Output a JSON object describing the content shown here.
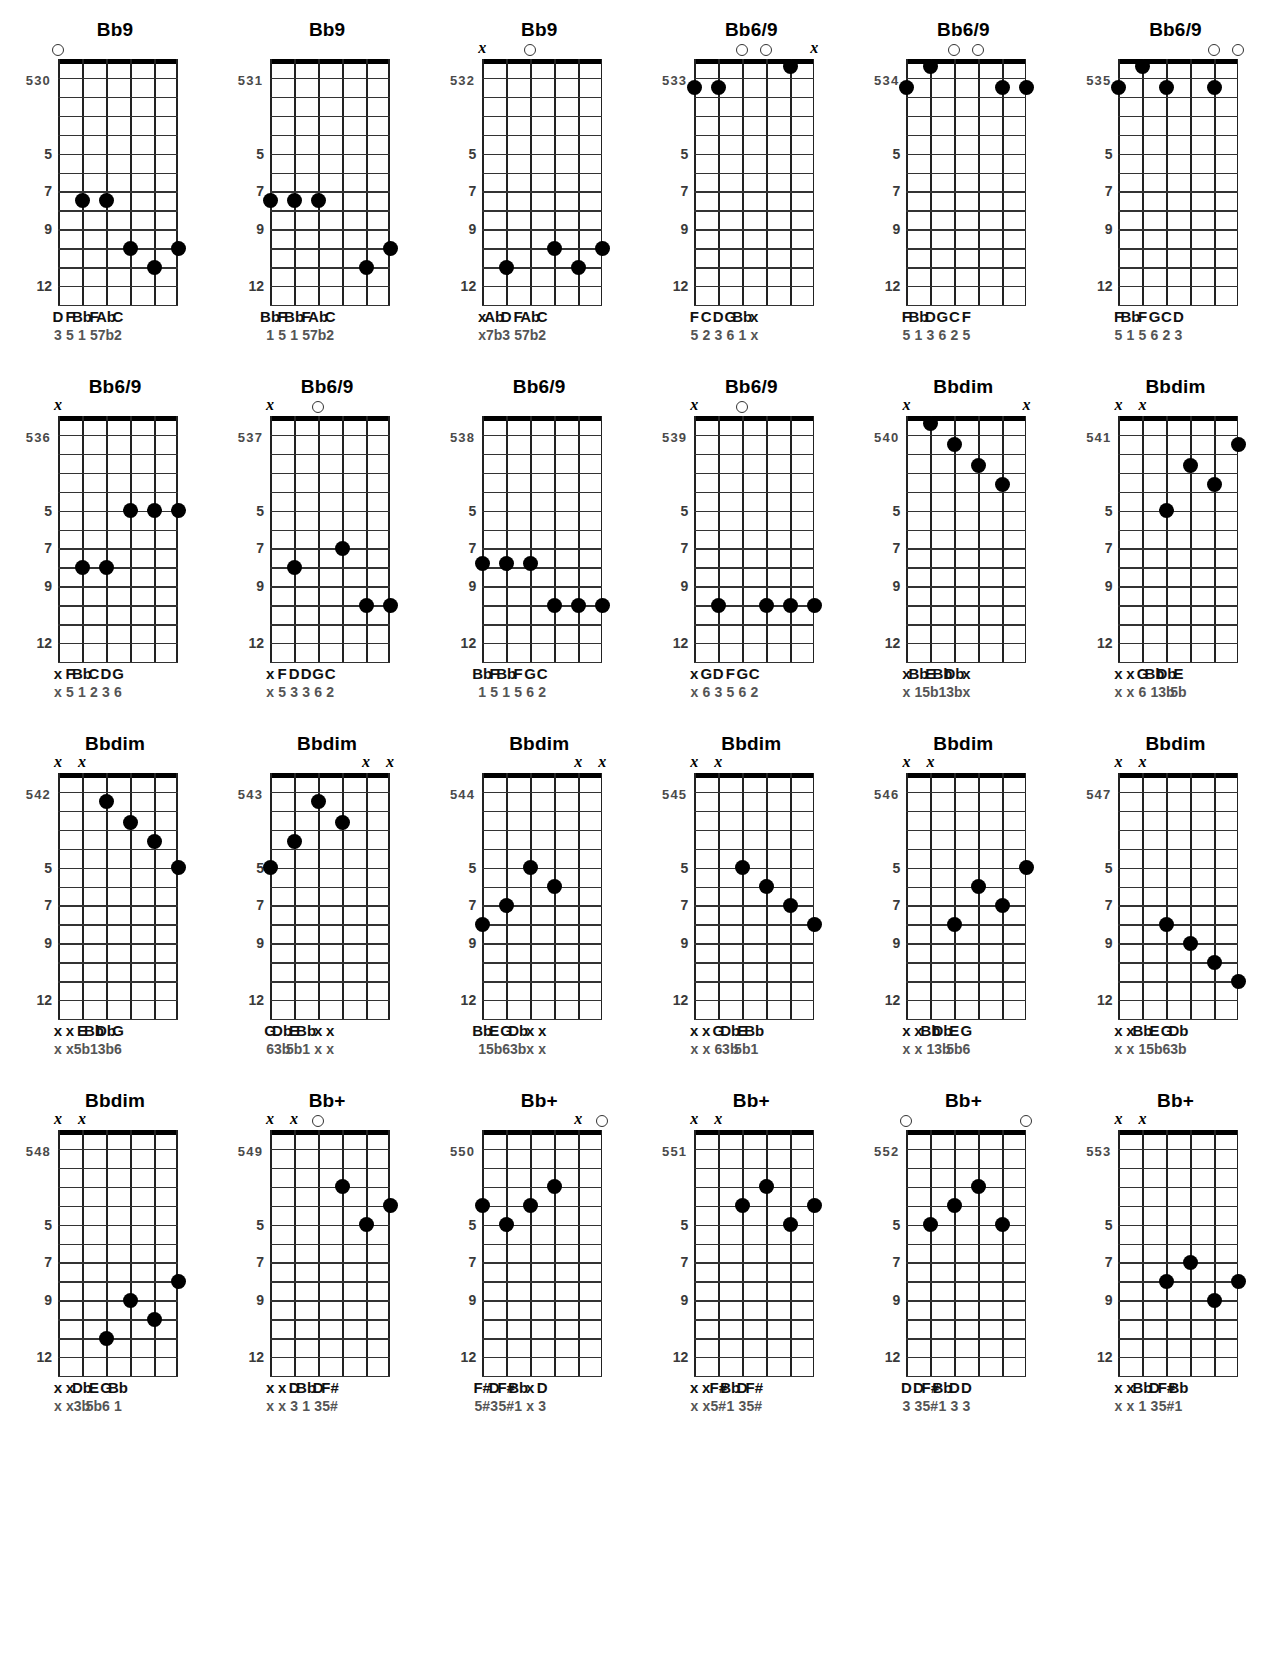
{
  "meta": {
    "strings": 6,
    "frets": 13,
    "fret_labels": [
      {
        "fret": "5",
        "line": 5
      },
      {
        "fret": "7",
        "line": 7
      },
      {
        "fret": "9",
        "line": 9
      },
      {
        "fret": "12",
        "line": 12
      }
    ],
    "marker_open": "o",
    "marker_mute": "x",
    "ink": "#000000"
  },
  "charts": [
    {
      "num": "530",
      "name": "Bb9",
      "marks": [
        "o",
        "",
        "",
        "",
        "",
        ""
      ],
      "dots": [
        null,
        7.5,
        7.5,
        10,
        11,
        10
      ],
      "notes": [
        "D",
        "F",
        "Bb",
        "F",
        "Ab",
        "C"
      ],
      "degrees": [
        "3",
        "5",
        "1",
        "5",
        "7b",
        "2"
      ]
    },
    {
      "num": "531",
      "name": "Bb9",
      "marks": [
        "",
        "",
        "",
        "",
        "",
        ""
      ],
      "dots": [
        7.5,
        7.5,
        7.5,
        null,
        11,
        10
      ],
      "notes": [
        "Bb",
        "F",
        "Bb",
        "F",
        "Ab",
        "C"
      ],
      "degrees": [
        "1",
        "5",
        "1",
        "5",
        "7b",
        "2"
      ]
    },
    {
      "num": "532",
      "name": "Bb9",
      "marks": [
        "x",
        "",
        "o",
        "",
        "",
        ""
      ],
      "dots": [
        null,
        11,
        null,
        10,
        11,
        10
      ],
      "notes": [
        "x",
        "Ab",
        "D",
        "F",
        "Ab",
        "C"
      ],
      "degrees": [
        "x",
        "7b",
        "3",
        "5",
        "7b",
        "2"
      ]
    },
    {
      "num": "533",
      "name": "Bb6/9",
      "marks": [
        "",
        "",
        "o",
        "o",
        "",
        "x"
      ],
      "dots": [
        1.5,
        1.5,
        null,
        null,
        0.4,
        null
      ],
      "notes": [
        "F",
        "C",
        "D",
        "G",
        "Bb",
        "x"
      ],
      "degrees": [
        "5",
        "2",
        "3",
        "6",
        "1",
        "x"
      ]
    },
    {
      "num": "534",
      "name": "Bb6/9",
      "marks": [
        "",
        "",
        "o",
        "o",
        "",
        ""
      ],
      "dots": [
        1.5,
        0.4,
        null,
        null,
        1.5,
        1.5
      ],
      "notes": [
        "F",
        "Bb",
        "D",
        "G",
        "C",
        "F"
      ],
      "degrees": [
        "5",
        "1",
        "3",
        "6",
        "2",
        "5"
      ]
    },
    {
      "num": "535",
      "name": "Bb6/9",
      "marks": [
        "",
        "",
        "",
        "",
        "o",
        "o"
      ],
      "dots": [
        1.5,
        0.4,
        1.5,
        null,
        1.5,
        null
      ],
      "notes": [
        "F",
        "Bb",
        "F",
        "G",
        "C",
        "D"
      ],
      "degrees": [
        "5",
        "1",
        "5",
        "6",
        "2",
        "3"
      ]
    },
    {
      "num": "536",
      "name": "Bb6/9",
      "marks": [
        "x",
        "",
        "",
        "",
        "",
        ""
      ],
      "dots": [
        null,
        8,
        8,
        5,
        5,
        5
      ],
      "notes": [
        "x",
        "F",
        "Bb",
        "C",
        "D",
        "G"
      ],
      "degrees": [
        "x",
        "5",
        "1",
        "2",
        "3",
        "6"
      ]
    },
    {
      "num": "537",
      "name": "Bb6/9",
      "marks": [
        "x",
        "",
        "o",
        "",
        "",
        ""
      ],
      "dots": [
        null,
        8,
        null,
        7,
        10,
        10
      ],
      "notes": [
        "x",
        "F",
        "D",
        "D",
        "G",
        "C"
      ],
      "degrees": [
        "x",
        "5",
        "3",
        "3",
        "6",
        "2"
      ]
    },
    {
      "num": "538",
      "name": "Bb6/9",
      "marks": [
        "",
        "",
        "",
        "",
        "",
        ""
      ],
      "dots": [
        7.8,
        7.8,
        7.8,
        10,
        10,
        10
      ],
      "notes": [
        "Bb",
        "F",
        "Bb",
        "F",
        "G",
        "C"
      ],
      "degrees": [
        "1",
        "5",
        "1",
        "5",
        "6",
        "2"
      ]
    },
    {
      "num": "539",
      "name": "Bb6/9",
      "marks": [
        "x",
        "",
        "o",
        "",
        "",
        ""
      ],
      "dots": [
        null,
        10,
        null,
        10,
        10,
        10
      ],
      "notes": [
        "x",
        "G",
        "D",
        "F",
        "G",
        "C"
      ],
      "degrees": [
        "x",
        "6",
        "3",
        "5",
        "6",
        "2"
      ]
    },
    {
      "num": "540",
      "name": "Bbdim",
      "marks": [
        "x",
        "",
        "",
        "",
        "",
        "x"
      ],
      "dots": [
        null,
        0.4,
        1.5,
        2.6,
        3.6,
        null
      ],
      "notes": [
        "x",
        "Bb",
        "E",
        "Bb",
        "Db",
        "x"
      ],
      "degrees": [
        "x",
        "1",
        "5b",
        "1",
        "3b",
        "x"
      ]
    },
    {
      "num": "541",
      "name": "Bbdim",
      "marks": [
        "x",
        "x",
        "",
        "",
        "",
        ""
      ],
      "dots": [
        null,
        null,
        5,
        2.6,
        3.6,
        1.5
      ],
      "notes": [
        "x",
        "x",
        "G",
        "Bb",
        "Db",
        "E"
      ],
      "degrees": [
        "x",
        "x",
        "6",
        "1",
        "3b",
        "5b"
      ]
    },
    {
      "num": "542",
      "name": "Bbdim",
      "marks": [
        "x",
        "x",
        "",
        "",
        "",
        ""
      ],
      "dots": [
        null,
        null,
        1.5,
        2.6,
        3.6,
        5
      ],
      "notes": [
        "x",
        "x",
        "E",
        "Bb",
        "Db",
        "G"
      ],
      "degrees": [
        "x",
        "x",
        "5b",
        "1",
        "3b",
        "6"
      ]
    },
    {
      "num": "543",
      "name": "Bbdim",
      "marks": [
        "",
        "",
        "",
        "",
        "x",
        "x"
      ],
      "dots": [
        5,
        3.6,
        1.5,
        2.6,
        null,
        null
      ],
      "notes": [
        "G",
        "Db",
        "E",
        "Bb",
        "x",
        "x"
      ],
      "degrees": [
        "6",
        "3b",
        "5b",
        "1",
        "x",
        "x"
      ]
    },
    {
      "num": "544",
      "name": "Bbdim",
      "marks": [
        "",
        "",
        "",
        "",
        "x",
        "x"
      ],
      "dots": [
        8,
        7,
        5,
        6,
        null,
        null
      ],
      "notes": [
        "Bb",
        "E",
        "G",
        "Db",
        "x",
        "x"
      ],
      "degrees": [
        "1",
        "5b",
        "6",
        "3b",
        "x",
        "x"
      ]
    },
    {
      "num": "545",
      "name": "Bbdim",
      "marks": [
        "x",
        "x",
        "",
        "",
        "",
        ""
      ],
      "dots": [
        null,
        null,
        5,
        6,
        7,
        8
      ],
      "notes": [
        "x",
        "x",
        "G",
        "Db",
        "E",
        "Bb"
      ],
      "degrees": [
        "x",
        "x",
        "6",
        "3b",
        "5b",
        "1"
      ]
    },
    {
      "num": "546",
      "name": "Bbdim",
      "marks": [
        "x",
        "x",
        "",
        "",
        "",
        ""
      ],
      "dots": [
        null,
        null,
        8,
        6,
        7,
        5
      ],
      "notes": [
        "x",
        "x",
        "Bb",
        "Db",
        "E",
        "G"
      ],
      "degrees": [
        "x",
        "x",
        "1",
        "3b",
        "5b",
        "6"
      ]
    },
    {
      "num": "547",
      "name": "Bbdim",
      "marks": [
        "x",
        "x",
        "",
        "",
        "",
        ""
      ],
      "dots": [
        null,
        null,
        8,
        9,
        10,
        11
      ],
      "notes": [
        "x",
        "x",
        "Bb",
        "E",
        "G",
        "Db"
      ],
      "degrees": [
        "x",
        "x",
        "1",
        "5b",
        "6",
        "3b"
      ]
    },
    {
      "num": "548",
      "name": "Bbdim",
      "marks": [
        "x",
        "x",
        "",
        "",
        "",
        ""
      ],
      "dots": [
        null,
        null,
        11,
        9,
        10,
        8
      ],
      "notes": [
        "x",
        "x",
        "Db",
        "E",
        "G",
        "Bb"
      ],
      "degrees": [
        "x",
        "x",
        "3b",
        "5b",
        "6",
        "1"
      ]
    },
    {
      "num": "549",
      "name": "Bb+",
      "marks": [
        "x",
        "x",
        "o",
        "",
        "",
        ""
      ],
      "dots": [
        null,
        null,
        null,
        3,
        5,
        4
      ],
      "notes": [
        "x",
        "x",
        "D",
        "Bb",
        "D",
        "F#"
      ],
      "degrees": [
        "x",
        "x",
        "3",
        "1",
        "3",
        "5#"
      ]
    },
    {
      "num": "550",
      "name": "Bb+",
      "marks": [
        "",
        "",
        "",
        "",
        "x",
        "o"
      ],
      "dots": [
        4,
        5,
        4,
        3,
        null,
        null
      ],
      "notes": [
        "F#",
        "D",
        "F#",
        "Bb",
        "x",
        "D"
      ],
      "degrees": [
        "5#",
        "3",
        "5#",
        "1",
        "x",
        "3"
      ]
    },
    {
      "num": "551",
      "name": "Bb+",
      "marks": [
        "x",
        "x",
        "",
        "",
        "",
        ""
      ],
      "dots": [
        null,
        null,
        4,
        3,
        5,
        4
      ],
      "notes": [
        "x",
        "x",
        "F#",
        "Bb",
        "D",
        "F#"
      ],
      "degrees": [
        "x",
        "x",
        "5#",
        "1",
        "3",
        "5#"
      ]
    },
    {
      "num": "552",
      "name": "Bb+",
      "marks": [
        "o",
        "",
        "",
        "",
        "",
        "o"
      ],
      "dots": [
        null,
        5,
        4,
        3,
        5,
        null
      ],
      "notes": [
        "D",
        "D",
        "F#",
        "Bb",
        "D",
        "D"
      ],
      "degrees": [
        "3",
        "3",
        "5#",
        "1",
        "3",
        "3"
      ]
    },
    {
      "num": "553",
      "name": "Bb+",
      "marks": [
        "x",
        "x",
        "",
        "",
        "",
        ""
      ],
      "dots": [
        null,
        null,
        8,
        7,
        9,
        8
      ],
      "notes": [
        "x",
        "x",
        "Bb",
        "D",
        "F#",
        "Bb"
      ],
      "degrees": [
        "x",
        "x",
        "1",
        "3",
        "5#",
        "1"
      ]
    }
  ]
}
